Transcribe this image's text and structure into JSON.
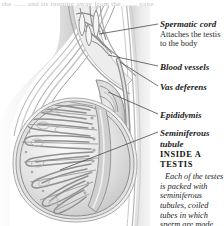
{
  "page": {
    "top_partial_text": "the ...... and its running away from the ....... page",
    "background_color": "#ffffff",
    "ink_color": "#1d1d1d"
  },
  "illustration": {
    "name": "testis-cross-section",
    "description": "Grayscale cutaway illustration of a testis showing the spermatic cord, blood vessels, vas deferens, epididymis and radiating lobules of seminiferous tubules",
    "tone_light": "#f2f2f2",
    "tone_mid": "#c9c9c9",
    "tone_dark": "#8f8f8f",
    "outline": "#6e6e6e"
  },
  "labels": [
    {
      "id": "spermatic-cord",
      "term": "Spermatic cord",
      "description": "Attaches the testis\nto the body",
      "desc_line1": "Attaches the testis",
      "desc_line2": "to the body"
    },
    {
      "id": "blood-vessels",
      "term": "Blood vessels"
    },
    {
      "id": "vas-deferens",
      "term": "Vas deferens"
    },
    {
      "id": "epididymis",
      "term": "Epididymis"
    },
    {
      "id": "seminiferous-tubule",
      "term": "Seminiferous tubule"
    }
  ],
  "note": {
    "heading_line1": "INSIDE A",
    "heading_line2": "TESTIS",
    "body": "Each of the testes is packed with seminiferous tubules, coiled tubes in which sperm are made."
  }
}
